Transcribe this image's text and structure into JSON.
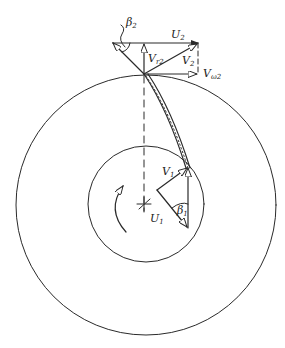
{
  "diagram": {
    "type": "centrifugal pump impeller with inlet and outlet velocity triangles",
    "colors": {
      "ink": "#2a2a2a",
      "background": "#ffffff"
    },
    "outer_circle": {
      "cx": 146,
      "cy": 205,
      "r": 130
    },
    "inner_circle": {
      "cx": 146,
      "cy": 204,
      "r": 58
    },
    "center": {
      "x": 144,
      "y": 204
    },
    "labels": {
      "beta2": "β",
      "beta2_sub": "2",
      "u2": "U",
      "u2_sub": "2",
      "vr2": "V",
      "vr2_sub": "r2",
      "v2": "V",
      "v2_sub": "2",
      "vw2": "V",
      "vw2_sub": "ω2",
      "v1": "V",
      "v1_sub": "1",
      "u1": "U",
      "u1_sub": "1",
      "beta1": "β",
      "beta1_sub": "1"
    },
    "outlet_triangle": {
      "blade_tip": [
        144,
        74
      ],
      "u2_line": {
        "from": [
          113,
          43
        ],
        "to": [
          198,
          43
        ]
      },
      "vr2": {
        "from": [
          144,
          74
        ],
        "to": [
          144,
          43
        ]
      },
      "v2": {
        "from": [
          144,
          74
        ],
        "to": [
          198,
          43
        ]
      },
      "vw2": {
        "from": [
          144,
          74
        ],
        "to": [
          198,
          74
        ]
      },
      "w2": {
        "from": [
          144,
          74
        ],
        "to": [
          113,
          43
        ]
      }
    },
    "inlet_triangle": {
      "blade_root": [
        188,
        167
      ],
      "v1": {
        "from": [
          157,
          190
        ],
        "to": [
          188,
          167
        ]
      },
      "u1": {
        "from": [
          157,
          190
        ],
        "to": [
          188,
          228
        ]
      },
      "w1": {
        "from": [
          188,
          228
        ],
        "to": [
          188,
          167
        ]
      }
    },
    "rotation_direction": "counter-clockwise"
  }
}
